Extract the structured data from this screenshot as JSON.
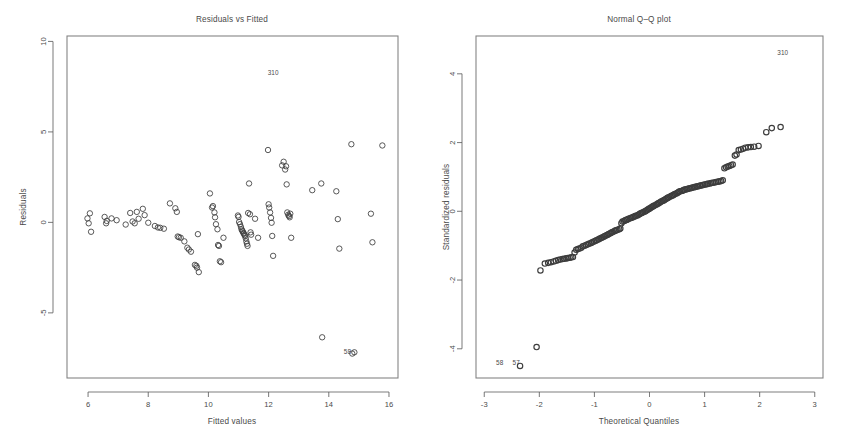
{
  "figure": {
    "background_color": "#ffffff",
    "ink_color": "#4a4a4a",
    "point_stroke_color": "#3d3d3d"
  },
  "panels": [
    {
      "id": "residuals-vs-fitted",
      "title": "Residuals vs Fitted",
      "xlabel": "Fitted values",
      "ylabel": "Residuals"
    },
    {
      "id": "normal-qq-plot",
      "title": "Normal Q–Q plot",
      "xlabel": "Theoretical Quantiles",
      "ylabel": "Standardized residuals"
    }
  ],
  "chart_data": [
    {
      "type": "scatter",
      "id": "residuals-vs-fitted",
      "title": "Residuals vs Fitted",
      "xlabel": "Fitted values",
      "ylabel": "Residuals",
      "xlim": [
        5.3,
        16.3
      ],
      "ylim": [
        -8.6,
        10.3
      ],
      "xticks": [
        6,
        8,
        10,
        12,
        14,
        16
      ],
      "xtick_labels": [
        "6",
        "8",
        "10",
        "12",
        "14",
        "16"
      ],
      "yticks": [
        10,
        5,
        0,
        -5
      ],
      "ytick_labels": [
        "10",
        "5",
        "0",
        "-5"
      ],
      "grid": false,
      "legend": "none",
      "marker": "open-circle",
      "annotations": [
        {
          "text": "310",
          "x": 12.15,
          "y": 8.15
        },
        {
          "text": "58",
          "x": 14.62,
          "y": -7.3
        }
      ],
      "points": [
        [
          5.98,
          0.22
        ],
        [
          6.02,
          -0.05
        ],
        [
          6.06,
          0.5
        ],
        [
          6.1,
          -0.52
        ],
        [
          6.55,
          0.3
        ],
        [
          6.6,
          -0.05
        ],
        [
          6.62,
          0.08
        ],
        [
          6.78,
          0.22
        ],
        [
          6.95,
          0.12
        ],
        [
          7.25,
          -0.12
        ],
        [
          7.4,
          0.52
        ],
        [
          7.48,
          0.05
        ],
        [
          7.55,
          -0.05
        ],
        [
          7.62,
          0.58
        ],
        [
          7.68,
          0.2
        ],
        [
          7.82,
          0.75
        ],
        [
          7.88,
          0.4
        ],
        [
          8.0,
          -0.02
        ],
        [
          8.22,
          -0.2
        ],
        [
          8.32,
          -0.28
        ],
        [
          8.4,
          -0.3
        ],
        [
          8.52,
          -0.35
        ],
        [
          8.72,
          1.05
        ],
        [
          8.9,
          0.78
        ],
        [
          8.95,
          0.58
        ],
        [
          8.98,
          -0.78
        ],
        [
          9.02,
          -0.82
        ],
        [
          9.08,
          -0.85
        ],
        [
          9.2,
          -1.05
        ],
        [
          9.3,
          -1.4
        ],
        [
          9.35,
          -1.5
        ],
        [
          9.42,
          -1.62
        ],
        [
          9.55,
          -2.35
        ],
        [
          9.6,
          -2.4
        ],
        [
          9.62,
          -2.5
        ],
        [
          9.65,
          -0.65
        ],
        [
          9.68,
          -2.75
        ],
        [
          10.05,
          1.6
        ],
        [
          10.12,
          0.82
        ],
        [
          10.15,
          0.9
        ],
        [
          10.2,
          0.55
        ],
        [
          10.22,
          0.28
        ],
        [
          10.25,
          -0.1
        ],
        [
          10.3,
          -0.38
        ],
        [
          10.32,
          -1.25
        ],
        [
          10.35,
          -1.3
        ],
        [
          10.38,
          -2.15
        ],
        [
          10.42,
          -2.2
        ],
        [
          10.5,
          -0.85
        ],
        [
          10.98,
          0.38
        ],
        [
          11.0,
          0.3
        ],
        [
          11.02,
          0.02
        ],
        [
          11.05,
          -0.1
        ],
        [
          11.08,
          -0.25
        ],
        [
          11.1,
          -0.38
        ],
        [
          11.12,
          -0.45
        ],
        [
          11.14,
          -0.5
        ],
        [
          11.16,
          -0.58
        ],
        [
          11.18,
          -0.62
        ],
        [
          11.2,
          -0.7
        ],
        [
          11.22,
          -0.75
        ],
        [
          11.24,
          -0.88
        ],
        [
          11.26,
          -1.05
        ],
        [
          11.28,
          -1.18
        ],
        [
          11.3,
          -1.3
        ],
        [
          11.32,
          0.52
        ],
        [
          11.35,
          2.15
        ],
        [
          11.38,
          0.45
        ],
        [
          11.4,
          -0.55
        ],
        [
          11.42,
          -0.68
        ],
        [
          11.55,
          0.2
        ],
        [
          11.65,
          -0.85
        ],
        [
          11.98,
          4.0
        ],
        [
          12.0,
          1.0
        ],
        [
          12.02,
          0.82
        ],
        [
          12.05,
          0.55
        ],
        [
          12.08,
          0.25
        ],
        [
          12.1,
          -0.02
        ],
        [
          12.12,
          -0.75
        ],
        [
          12.15,
          -1.85
        ],
        [
          12.45,
          3.15
        ],
        [
          12.5,
          3.35
        ],
        [
          12.55,
          2.92
        ],
        [
          12.58,
          3.1
        ],
        [
          12.6,
          2.1
        ],
        [
          12.62,
          0.55
        ],
        [
          12.65,
          0.42
        ],
        [
          12.68,
          0.35
        ],
        [
          12.7,
          0.28
        ],
        [
          12.72,
          0.48
        ],
        [
          12.75,
          -0.85
        ],
        [
          13.45,
          1.78
        ],
        [
          13.75,
          2.15
        ],
        [
          13.78,
          -6.35
        ],
        [
          14.25,
          1.72
        ],
        [
          14.3,
          0.18
        ],
        [
          14.35,
          -1.45
        ],
        [
          14.75,
          4.32
        ],
        [
          14.78,
          -7.25
        ],
        [
          14.85,
          -7.18
        ],
        [
          15.4,
          0.48
        ],
        [
          15.45,
          -1.1
        ],
        [
          15.78,
          4.25
        ]
      ]
    },
    {
      "type": "scatter",
      "id": "normal-qq-plot",
      "title": "Normal Q–Q plot",
      "xlabel": "Theoretical Quantiles",
      "ylabel": "Standardized residuals",
      "xlim": [
        -3.15,
        3.15
      ],
      "ylim": [
        -4.85,
        5.1
      ],
      "xticks": [
        -3,
        -2,
        -1,
        0,
        1,
        2,
        3
      ],
      "xtick_labels": [
        "-3",
        "-2",
        "-1",
        "0",
        "1",
        "2",
        "3"
      ],
      "yticks": [
        4,
        2,
        0,
        -2,
        -4
      ],
      "ytick_labels": [
        "4",
        "2",
        "0",
        "-2",
        "-4"
      ],
      "grid": false,
      "legend": "none",
      "marker": "open-circle",
      "annotations": [
        {
          "text": "310",
          "x": 2.42,
          "y": 4.55
        },
        {
          "text": "58",
          "x": -2.72,
          "y": -4.48
        },
        {
          "text": "57",
          "x": -2.42,
          "y": -4.48
        }
      ],
      "points": [
        [
          -2.35,
          -4.5
        ],
        [
          -2.05,
          -3.95
        ],
        [
          -1.98,
          -1.72
        ],
        [
          -1.9,
          -1.52
        ],
        [
          -1.84,
          -1.5
        ],
        [
          -1.79,
          -1.48
        ],
        [
          -1.74,
          -1.46
        ],
        [
          -1.7,
          -1.44
        ],
        [
          -1.66,
          -1.42
        ],
        [
          -1.62,
          -1.4
        ],
        [
          -1.58,
          -1.39
        ],
        [
          -1.55,
          -1.38
        ],
        [
          -1.51,
          -1.37
        ],
        [
          -1.48,
          -1.36
        ],
        [
          -1.45,
          -1.35
        ],
        [
          -1.42,
          -1.34
        ],
        [
          -1.39,
          -1.33
        ],
        [
          -1.36,
          -1.2
        ],
        [
          -1.33,
          -1.12
        ],
        [
          -1.3,
          -1.1
        ],
        [
          -1.27,
          -1.08
        ],
        [
          -1.24,
          -1.06
        ],
        [
          -1.21,
          -1.02
        ],
        [
          -1.18,
          -1.0
        ],
        [
          -1.15,
          -0.98
        ],
        [
          -1.12,
          -0.96
        ],
        [
          -1.09,
          -0.94
        ],
        [
          -1.06,
          -0.92
        ],
        [
          -1.04,
          -0.9
        ],
        [
          -1.01,
          -0.88
        ],
        [
          -0.98,
          -0.86
        ],
        [
          -0.96,
          -0.84
        ],
        [
          -0.93,
          -0.82
        ],
        [
          -0.91,
          -0.8
        ],
        [
          -0.88,
          -0.78
        ],
        [
          -0.86,
          -0.76
        ],
        [
          -0.83,
          -0.74
        ],
        [
          -0.81,
          -0.72
        ],
        [
          -0.78,
          -0.7
        ],
        [
          -0.76,
          -0.68
        ],
        [
          -0.74,
          -0.66
        ],
        [
          -0.71,
          -0.64
        ],
        [
          -0.69,
          -0.62
        ],
        [
          -0.67,
          -0.6
        ],
        [
          -0.64,
          -0.58
        ],
        [
          -0.62,
          -0.56
        ],
        [
          -0.6,
          -0.55
        ],
        [
          -0.58,
          -0.54
        ],
        [
          -0.55,
          -0.52
        ],
        [
          -0.53,
          -0.5
        ],
        [
          -0.51,
          -0.35
        ],
        [
          -0.49,
          -0.3
        ],
        [
          -0.46,
          -0.28
        ],
        [
          -0.44,
          -0.26
        ],
        [
          -0.42,
          -0.25
        ],
        [
          -0.4,
          -0.24
        ],
        [
          -0.38,
          -0.22
        ],
        [
          -0.35,
          -0.2
        ],
        [
          -0.33,
          -0.19
        ],
        [
          -0.31,
          -0.18
        ],
        [
          -0.29,
          -0.16
        ],
        [
          -0.27,
          -0.15
        ],
        [
          -0.25,
          -0.13
        ],
        [
          -0.22,
          -0.12
        ],
        [
          -0.2,
          -0.1
        ],
        [
          -0.18,
          -0.08
        ],
        [
          -0.16,
          -0.06
        ],
        [
          -0.14,
          -0.05
        ],
        [
          -0.12,
          -0.03
        ],
        [
          -0.09,
          -0.01
        ],
        [
          -0.07,
          0.01
        ],
        [
          -0.05,
          0.03
        ],
        [
          -0.03,
          0.05
        ],
        [
          -0.01,
          0.07
        ],
        [
          0.01,
          0.09
        ],
        [
          0.03,
          0.11
        ],
        [
          0.05,
          0.13
        ],
        [
          0.07,
          0.15
        ],
        [
          0.09,
          0.17
        ],
        [
          0.12,
          0.19
        ],
        [
          0.14,
          0.21
        ],
        [
          0.16,
          0.23
        ],
        [
          0.18,
          0.25
        ],
        [
          0.2,
          0.27
        ],
        [
          0.22,
          0.29
        ],
        [
          0.25,
          0.31
        ],
        [
          0.27,
          0.33
        ],
        [
          0.29,
          0.35
        ],
        [
          0.31,
          0.37
        ],
        [
          0.33,
          0.39
        ],
        [
          0.35,
          0.41
        ],
        [
          0.38,
          0.43
        ],
        [
          0.4,
          0.45
        ],
        [
          0.42,
          0.46
        ],
        [
          0.44,
          0.48
        ],
        [
          0.46,
          0.5
        ],
        [
          0.49,
          0.52
        ],
        [
          0.51,
          0.54
        ],
        [
          0.53,
          0.56
        ],
        [
          0.55,
          0.58
        ],
        [
          0.58,
          0.59
        ],
        [
          0.6,
          0.6
        ],
        [
          0.62,
          0.62
        ],
        [
          0.64,
          0.63
        ],
        [
          0.67,
          0.64
        ],
        [
          0.69,
          0.65
        ],
        [
          0.71,
          0.66
        ],
        [
          0.74,
          0.67
        ],
        [
          0.76,
          0.68
        ],
        [
          0.78,
          0.69
        ],
        [
          0.81,
          0.7
        ],
        [
          0.83,
          0.71
        ],
        [
          0.86,
          0.72
        ],
        [
          0.88,
          0.73
        ],
        [
          0.91,
          0.74
        ],
        [
          0.93,
          0.75
        ],
        [
          0.96,
          0.76
        ],
        [
          0.98,
          0.77
        ],
        [
          1.01,
          0.78
        ],
        [
          1.04,
          0.79
        ],
        [
          1.06,
          0.8
        ],
        [
          1.09,
          0.81
        ],
        [
          1.12,
          0.82
        ],
        [
          1.15,
          0.83
        ],
        [
          1.18,
          0.84
        ],
        [
          1.21,
          0.85
        ],
        [
          1.24,
          0.86
        ],
        [
          1.27,
          0.87
        ],
        [
          1.3,
          0.88
        ],
        [
          1.33,
          0.9
        ],
        [
          1.36,
          1.25
        ],
        [
          1.39,
          1.28
        ],
        [
          1.42,
          1.3
        ],
        [
          1.45,
          1.32
        ],
        [
          1.48,
          1.34
        ],
        [
          1.51,
          1.36
        ],
        [
          1.55,
          1.62
        ],
        [
          1.58,
          1.65
        ],
        [
          1.62,
          1.78
        ],
        [
          1.66,
          1.8
        ],
        [
          1.7,
          1.82
        ],
        [
          1.74,
          1.85
        ],
        [
          1.79,
          1.86
        ],
        [
          1.84,
          1.87
        ],
        [
          1.9,
          1.88
        ],
        [
          1.98,
          1.9
        ],
        [
          2.12,
          2.3
        ],
        [
          2.22,
          2.42
        ],
        [
          2.38,
          2.45
        ]
      ]
    }
  ]
}
